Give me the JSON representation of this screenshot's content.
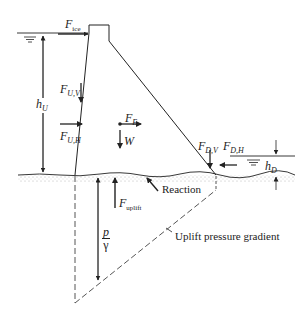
{
  "diagram": {
    "labels": {
      "f_ice": {
        "main": "F",
        "sub": "ice"
      },
      "f_uv": {
        "main": "F",
        "sub": "U,V"
      },
      "f_uh": {
        "main": "F",
        "sub": "U,H"
      },
      "h_u": {
        "main": "h",
        "sub": "U"
      },
      "f_e": {
        "main": "F",
        "sub": "E"
      },
      "w": {
        "main": "W"
      },
      "f_dv": {
        "main": "F",
        "sub": "D,V"
      },
      "f_dh": {
        "main": "F",
        "sub": "D,H"
      },
      "h_d": {
        "main": "h",
        "sub": "D"
      },
      "f_uplift": {
        "main": "F",
        "sub": "uplift"
      },
      "reaction": "Reaction",
      "p_num": "p",
      "p_den": "γ",
      "uplift_gradient": "Uplift pressure gradient"
    },
    "colors": {
      "line": "#222222",
      "ground": "#999999",
      "background": "#ffffff"
    }
  }
}
